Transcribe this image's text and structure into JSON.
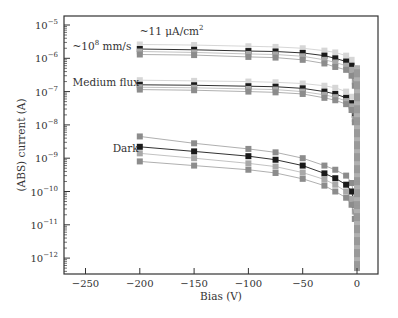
{
  "chart_data": {
    "type": "line",
    "title": "",
    "xlabel": "Bias (V)",
    "ylabel": "(ABS) current (A)",
    "xscale": "linear",
    "yscale": "log",
    "xlim": [
      -265,
      20
    ],
    "ylim": [
      3e-13,
      1.2e-05
    ],
    "xticks": [
      -250,
      -200,
      -150,
      -100,
      -50,
      0
    ],
    "xtick_labels": [
      "−250",
      "−200",
      "−150",
      "−100",
      "−50",
      "0"
    ],
    "yticks": [
      1e-05,
      1e-06,
      1e-07,
      1e-08,
      1e-09,
      1e-10,
      1e-11,
      1e-12
    ],
    "ytick_labels": [
      {
        "base": "10",
        "exp": "−5"
      },
      {
        "base": "10",
        "exp": "−6"
      },
      {
        "base": "10",
        "exp": "−7"
      },
      {
        "base": "10",
        "exp": "−8"
      },
      {
        "base": "10",
        "exp": "−9"
      },
      {
        "base": "10",
        "exp": "−10"
      },
      {
        "base": "10",
        "exp": "−11"
      },
      {
        "base": "10",
        "exp": "−12"
      }
    ],
    "grid": false,
    "legend": null,
    "annotations": [
      {
        "text": "~11 μA/cm",
        "sup": "2",
        "x": -200,
        "y": 5e-06
      },
      {
        "text": "~10",
        "sup": "8",
        "tail": " mm/s",
        "x": -262,
        "y": 1.8e-06
      },
      {
        "text": "Medium flux",
        "x": -262,
        "y": 1.5e-07
      },
      {
        "text": "Dark",
        "x": -225,
        "y": 1.5e-09
      }
    ],
    "x": [
      -200,
      -150,
      -100,
      -75,
      -50,
      -30,
      -20,
      -10,
      -5,
      -2,
      0
    ],
    "series": [
      {
        "name": "High flux A",
        "group": "high",
        "color": "#d6d6d6",
        "values": [
          2.6e-06,
          2.5e-06,
          2.3e-06,
          2.2e-06,
          2e-06,
          1.7e-06,
          1.5e-06,
          1.2e-06,
          9e-07,
          5e-07,
          1e-08
        ]
      },
      {
        "name": "High flux B",
        "group": "high",
        "color": "#1a1a1a",
        "values": [
          1.9e-06,
          1.8e-06,
          1.65e-06,
          1.6e-06,
          1.45e-06,
          1.2e-06,
          1e-06,
          8e-07,
          6e-07,
          3e-07,
          5e-09
        ]
      },
      {
        "name": "High flux C",
        "group": "high",
        "color": "#a8a8a8",
        "values": [
          1.6e-06,
          1.5e-06,
          1.35e-06,
          1.3e-06,
          1.15e-06,
          9e-07,
          7.5e-07,
          6e-07,
          4.5e-07,
          2e-07,
          3e-09
        ]
      },
      {
        "name": "High flux D",
        "group": "high",
        "color": "#8c8c8c",
        "values": [
          1.3e-06,
          1.25e-06,
          1.1e-06,
          1.05e-06,
          9e-07,
          7e-07,
          5.5e-07,
          4.5e-07,
          3e-07,
          1.5e-07,
          2e-09
        ]
      },
      {
        "name": "Medium flux A",
        "group": "medium",
        "color": "#d6d6d6",
        "values": [
          2.2e-07,
          2.1e-07,
          2e-07,
          1.9e-07,
          1.75e-07,
          1.5e-07,
          1.3e-07,
          1e-07,
          7e-08,
          3e-08,
          1e-09
        ]
      },
      {
        "name": "Medium flux B",
        "group": "medium",
        "color": "#1a1a1a",
        "values": [
          1.6e-07,
          1.55e-07,
          1.45e-07,
          1.4e-07,
          1.25e-07,
          1e-07,
          8.5e-08,
          6.5e-08,
          4.5e-08,
          2e-08,
          3.5e-09
        ]
      },
      {
        "name": "Medium flux C",
        "group": "medium",
        "color": "#a8a8a8",
        "values": [
          1.35e-07,
          1.3e-07,
          1.2e-07,
          1.15e-07,
          1e-07,
          8e-08,
          6.8e-08,
          5.2e-08,
          3.6e-08,
          1.5e-08,
          1.2e-09
        ]
      },
      {
        "name": "Medium flux D",
        "group": "medium",
        "color": "#8c8c8c",
        "values": [
          1.15e-07,
          1.1e-07,
          1e-07,
          9.5e-08,
          8.5e-08,
          6.5e-08,
          5.5e-08,
          4.2e-08,
          2.8e-08,
          1.2e-08,
          8e-10
        ]
      },
      {
        "name": "Dark A",
        "group": "dark",
        "color": "#8c8c8c",
        "values": [
          4.5e-09,
          2.8e-09,
          1.9e-09,
          1.5e-09,
          1e-09,
          6e-10,
          4.5e-10,
          3e-10,
          1.8e-10,
          6e-11,
          3e-12
        ]
      },
      {
        "name": "Dark B",
        "group": "dark",
        "color": "#1a1a1a",
        "values": [
          2.2e-09,
          1.6e-09,
          1.15e-09,
          9e-10,
          6e-10,
          3.5e-10,
          2.5e-10,
          1.6e-10,
          1e-10,
          4e-11,
          2e-12
        ]
      },
      {
        "name": "Dark C",
        "group": "dark",
        "color": "#a8a8a8",
        "values": [
          1.4e-09,
          1e-09,
          7e-10,
          5.6e-10,
          3.7e-10,
          2.3e-10,
          1.6e-10,
          1e-10,
          6e-11,
          2.5e-11,
          1.5e-12
        ]
      },
      {
        "name": "Dark D",
        "group": "dark",
        "color": "#8c8c8c",
        "values": [
          8e-10,
          6e-10,
          4.5e-10,
          3.6e-10,
          2.4e-10,
          1.5e-10,
          1e-10,
          6.5e-11,
          4e-11,
          1.5e-11,
          6e-13
        ]
      }
    ],
    "marker": "square",
    "colors": {
      "axis": "#333333",
      "light": "#d6d6d6",
      "mid": "#a8a8a8",
      "dark": "#8c8c8c",
      "black": "#1a1a1a"
    }
  }
}
